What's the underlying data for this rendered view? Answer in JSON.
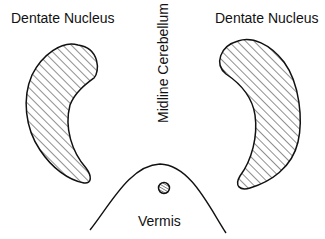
{
  "diagram": {
    "labels": {
      "left_nucleus": "Dentate Nucleus",
      "right_nucleus": "Dentate Nucleus",
      "midline": "Midline Cerebellum",
      "vermis": "Vermis"
    },
    "colors": {
      "stroke": "#111111",
      "background": "#ffffff"
    }
  }
}
